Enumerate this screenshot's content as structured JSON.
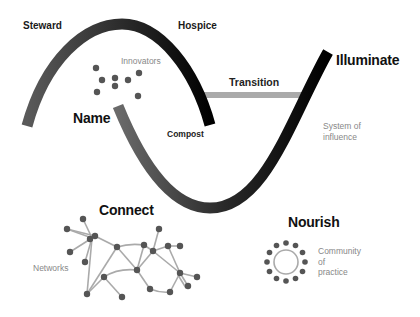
{
  "diagram": {
    "labels": {
      "steward": "Steward",
      "hospice": "Hospice",
      "innovators": "Innovators",
      "name": "Name",
      "compost": "Compost",
      "transition": "Transition",
      "illuminate": "Illuminate",
      "system_line1": "System of",
      "system_line2": "influence",
      "connect": "Connect",
      "networks": "Networks",
      "nourish": "Nourish",
      "community_line1": "Community",
      "community_line2": "of",
      "community_line3": "practice"
    },
    "colors": {
      "old_loop_start": "#555555",
      "old_loop_end": "#000000",
      "new_loop_start": "#666666",
      "new_loop_end": "#000000",
      "transition_bar": "#aaaaaa",
      "nodes": "#555555",
      "edges": "#aaaaaa",
      "ring": "#aaaaaa",
      "muted_text": "#888888"
    },
    "innovator_dots": [
      [
        96,
        68
      ],
      [
        102,
        80
      ],
      [
        115,
        78
      ],
      [
        128,
        80
      ],
      [
        139,
        73
      ],
      [
        97,
        92
      ],
      [
        115,
        86
      ],
      [
        138,
        96
      ]
    ],
    "community": {
      "center": [
        286,
        262
      ],
      "ring_radius": 12,
      "dot_radius": 19,
      "dot_count": 12
    }
  }
}
